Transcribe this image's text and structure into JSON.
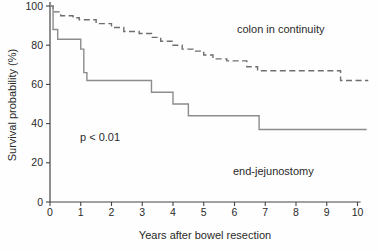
{
  "figure": {
    "p_value": "p < 0.01"
  },
  "chart_data": {
    "type": "line",
    "subtype": "kaplan-meier-step-curves",
    "title": "",
    "xlabel": "Years after bowel resection",
    "ylabel": "Survival probability (%)",
    "xlim": [
      0,
      10
    ],
    "ylim": [
      0,
      100
    ],
    "x_ticks": [
      0,
      1,
      2,
      3,
      4,
      5,
      6,
      7,
      8,
      9,
      10
    ],
    "y_ticks": [
      0,
      20,
      40,
      60,
      80,
      100
    ],
    "grid": false,
    "legend_position": "inline-annotations",
    "annotations": [
      {
        "text": "p < 0.01",
        "x": 1.1,
        "y": 33
      }
    ],
    "axis_color": "#444444",
    "series": [
      {
        "name": "colon in continuity",
        "style": "dashed",
        "color": "#6e6e6e",
        "points": [
          [
            0,
            100
          ],
          [
            0.1,
            97
          ],
          [
            0.35,
            95
          ],
          [
            0.75,
            94
          ],
          [
            0.95,
            93
          ],
          [
            1.5,
            91
          ],
          [
            2.0,
            89
          ],
          [
            2.4,
            87
          ],
          [
            2.9,
            86
          ],
          [
            3.3,
            84
          ],
          [
            3.6,
            82
          ],
          [
            4.0,
            80
          ],
          [
            4.3,
            78
          ],
          [
            4.65,
            77
          ],
          [
            5.0,
            75
          ],
          [
            5.3,
            73
          ],
          [
            5.75,
            72
          ],
          [
            6.4,
            69
          ],
          [
            6.75,
            67
          ],
          [
            9.45,
            62
          ]
        ],
        "end_x": 10.35
      },
      {
        "name": "end-jejunostomy",
        "style": "solid",
        "color": "#8c8c8c",
        "points": [
          [
            0,
            100
          ],
          [
            0.1,
            88
          ],
          [
            0.25,
            83
          ],
          [
            1.0,
            78
          ],
          [
            1.1,
            66
          ],
          [
            1.2,
            62
          ],
          [
            3.3,
            56
          ],
          [
            4.0,
            50
          ],
          [
            4.5,
            44
          ],
          [
            6.8,
            37
          ]
        ],
        "end_x": 10.3
      }
    ]
  }
}
